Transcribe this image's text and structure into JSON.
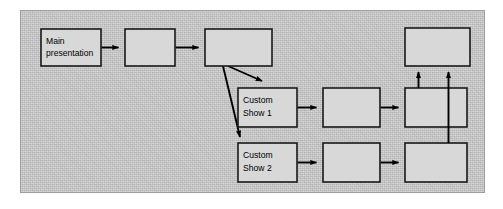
{
  "figure": {
    "panel": {
      "background_color": "#c9c9c9",
      "border_color": "#9d9d9d"
    },
    "style": {
      "box_fill": "#d8d8d8",
      "box_stroke": "#1a1a1a",
      "arrow_color": "#000000"
    }
  },
  "nodes": [
    {
      "id": "main-presentation",
      "label_line1": "Main",
      "label_line2": "presentation",
      "x": 41,
      "y": 29,
      "w": 60,
      "h": 37,
      "row": "top"
    },
    {
      "id": "top-slide-2",
      "label_line1": "",
      "label_line2": "",
      "x": 125,
      "y": 29,
      "w": 50,
      "h": 37,
      "row": "top"
    },
    {
      "id": "top-slide-3",
      "label_line1": "",
      "label_line2": "",
      "x": 205,
      "y": 29,
      "w": 67,
      "h": 37,
      "row": "top"
    },
    {
      "id": "top-right-slide",
      "label_line1": "",
      "label_line2": "",
      "x": 405,
      "y": 28,
      "w": 65,
      "h": 38,
      "row": "top"
    },
    {
      "id": "custom-show-1",
      "label_line1": "Custom",
      "label_line2": "Show 1",
      "x": 238,
      "y": 88,
      "w": 59,
      "h": 39,
      "row": "middle"
    },
    {
      "id": "middle-slide-2",
      "label_line1": "",
      "label_line2": "",
      "x": 323,
      "y": 88,
      "w": 57,
      "h": 39,
      "row": "middle"
    },
    {
      "id": "middle-slide-3",
      "label_line1": "",
      "label_line2": "",
      "x": 405,
      "y": 88,
      "w": 62,
      "h": 39,
      "row": "middle"
    },
    {
      "id": "custom-show-2",
      "label_line1": "Custom",
      "label_line2": "Show 2",
      "x": 238,
      "y": 143,
      "w": 59,
      "h": 39,
      "row": "bottom"
    },
    {
      "id": "bottom-slide-2",
      "label_line1": "",
      "label_line2": "",
      "x": 323,
      "y": 143,
      "w": 57,
      "h": 39,
      "row": "bottom"
    },
    {
      "id": "bottom-slide-3",
      "label_line1": "",
      "label_line2": "",
      "x": 405,
      "y": 143,
      "w": 62,
      "h": 39,
      "row": "bottom"
    }
  ],
  "edges": [
    {
      "id": "edge-main-to-top2",
      "from": "main-presentation",
      "to": "top-slide-2",
      "kind": "horizontal"
    },
    {
      "id": "edge-top2-to-top3",
      "from": "top-slide-2",
      "to": "top-slide-3",
      "kind": "horizontal"
    },
    {
      "id": "edge-top3-to-show1",
      "from": "top-slide-3",
      "to": "custom-show-1",
      "kind": "diagonal"
    },
    {
      "id": "edge-top3-to-show2",
      "from": "top-slide-3",
      "to": "custom-show-2",
      "kind": "diagonal"
    },
    {
      "id": "edge-show1-to-mid2",
      "from": "custom-show-1",
      "to": "middle-slide-2",
      "kind": "horizontal"
    },
    {
      "id": "edge-mid2-to-mid3",
      "from": "middle-slide-2",
      "to": "middle-slide-3",
      "kind": "horizontal"
    },
    {
      "id": "edge-show2-to-bot2",
      "from": "custom-show-2",
      "to": "bottom-slide-2",
      "kind": "horizontal"
    },
    {
      "id": "edge-bot2-to-bot3",
      "from": "bottom-slide-2",
      "to": "bottom-slide-3",
      "kind": "horizontal"
    },
    {
      "id": "edge-mid3-to-topright",
      "from": "middle-slide-3",
      "to": "top-right-slide",
      "kind": "vertical"
    },
    {
      "id": "edge-bot3-to-topright",
      "from": "bottom-slide-3",
      "to": "top-right-slide",
      "kind": "vertical-overlapping"
    }
  ]
}
